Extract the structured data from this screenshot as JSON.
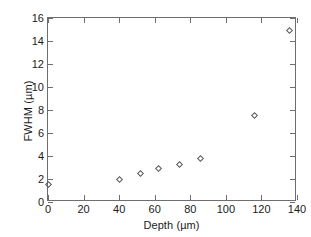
{
  "chart_data": {
    "type": "scatter",
    "title": "",
    "xlabel": "Depth (µm)",
    "ylabel": "FWHM (µm)",
    "xlim": [
      0,
      140
    ],
    "ylim": [
      0,
      16
    ],
    "xticks": [
      0,
      20,
      40,
      60,
      80,
      100,
      120,
      140
    ],
    "yticks": [
      0,
      2,
      4,
      6,
      8,
      10,
      12,
      14,
      16
    ],
    "xtick_labels": [
      "0",
      "20",
      "40",
      "60",
      "80",
      "100",
      "120",
      "140"
    ],
    "ytick_labels": [
      "0",
      "2",
      "4",
      "6",
      "8",
      "10",
      "12",
      "14",
      "16"
    ],
    "grid": false,
    "legend": null,
    "marker": "open-diamond",
    "marker_color": "#5a5a5a",
    "frame_color": "#6e6e6e",
    "series": [
      {
        "name": "FWHM vs Depth",
        "x": [
          0,
          40,
          52,
          62,
          74,
          86,
          116,
          136
        ],
        "y": [
          1.5,
          2.0,
          2.45,
          2.95,
          3.25,
          3.75,
          7.5,
          14.9
        ]
      }
    ]
  }
}
